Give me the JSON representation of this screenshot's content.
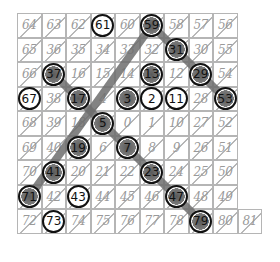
{
  "grid": {
    "cols": 9,
    "rows": [
      [
        "64",
        "63",
        "62",
        "61",
        "60",
        "59",
        "58",
        "57",
        "56"
      ],
      [
        "65",
        "36",
        "35",
        "34",
        "33",
        "32",
        "31",
        "30",
        "55"
      ],
      [
        "66",
        "37",
        "16",
        "15",
        "14",
        "13",
        "12",
        "29",
        "54"
      ],
      [
        "67",
        "38",
        "17",
        "4",
        "3",
        "2",
        "11",
        "28",
        "53"
      ],
      [
        "68",
        "39",
        "18",
        "5",
        "0",
        "1",
        "10",
        "27",
        "52"
      ],
      [
        "69",
        "40",
        "19",
        "6",
        "7",
        "8",
        "9",
        "26",
        "51"
      ],
      [
        "70",
        "41",
        "20",
        "21",
        "22",
        "23",
        "24",
        "25",
        "50"
      ],
      [
        "71",
        "42",
        "43",
        "44",
        "45",
        "46",
        "47",
        "48",
        "49"
      ],
      [
        "72",
        "73",
        "74",
        "75",
        "76",
        "77",
        "78",
        "79",
        "80",
        "81"
      ]
    ],
    "circled": [
      "61",
      "59",
      "31",
      "37",
      "13",
      "29",
      "67",
      "17",
      "3",
      "2",
      "11",
      "53",
      "5",
      "19",
      "7",
      "41",
      "23",
      "71",
      "43",
      "47",
      "73",
      "79"
    ],
    "shaded_circled": [
      "59",
      "31",
      "29",
      "53",
      "37",
      "17",
      "13",
      "3",
      "5",
      "19",
      "7",
      "41",
      "23",
      "71",
      "47",
      "79"
    ],
    "diagonal_lines": [
      {
        "from": "59",
        "to": "53"
      },
      {
        "from": "37",
        "to": "79"
      },
      {
        "from": "59",
        "to": "71"
      }
    ],
    "line_color": "#6e6e6e",
    "grid_color": "#b5b5b5",
    "text_color": "#9a9a9a",
    "circle_color": "#111111"
  }
}
